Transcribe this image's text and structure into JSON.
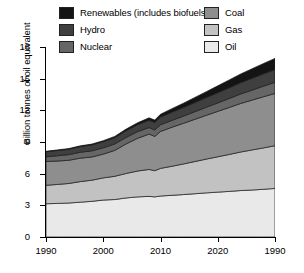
{
  "chart_data": {
    "type": "area",
    "stacked": true,
    "title": "",
    "subtitle": "",
    "xlabel": "",
    "ylabel": "Billion tonnes of oil equivalent",
    "xlim": [
      1990,
      2030
    ],
    "ylim": [
      0,
      18
    ],
    "yticks": [
      0,
      3,
      6,
      9,
      12,
      15,
      18
    ],
    "xticks": [
      1990,
      2000,
      2010,
      2020,
      1990
    ],
    "xtick_labels": [
      "1990",
      "2000",
      "2010",
      "2020",
      "1990"
    ],
    "grid": false,
    "legend_position": "top",
    "x": [
      1990,
      1992,
      1994,
      1996,
      1998,
      2000,
      2002,
      2004,
      2006,
      2008,
      2009,
      2010,
      2012,
      2014,
      2016,
      2018,
      2020,
      2022,
      2024,
      2026,
      2028,
      2030
    ],
    "series": [
      {
        "name": "Oil",
        "color": "#e9e9e9",
        "values": [
          3.15,
          3.18,
          3.22,
          3.3,
          3.38,
          3.5,
          3.55,
          3.7,
          3.8,
          3.85,
          3.8,
          3.88,
          3.95,
          4.02,
          4.1,
          4.18,
          4.25,
          4.32,
          4.4,
          4.45,
          4.52,
          4.6
        ]
      },
      {
        "name": "Gas",
        "color": "#c2c2c2",
        "values": [
          1.75,
          1.8,
          1.85,
          1.95,
          2.0,
          2.1,
          2.2,
          2.32,
          2.45,
          2.55,
          2.48,
          2.62,
          2.75,
          2.9,
          3.05,
          3.2,
          3.35,
          3.5,
          3.65,
          3.8,
          3.92,
          4.05
        ]
      },
      {
        "name": "Coal",
        "color": "#8e8e8e",
        "values": [
          2.25,
          2.22,
          2.2,
          2.22,
          2.2,
          2.25,
          2.45,
          2.8,
          3.1,
          3.35,
          3.25,
          3.5,
          3.7,
          3.85,
          4.0,
          4.15,
          4.3,
          4.45,
          4.6,
          4.72,
          4.85,
          4.95
        ]
      },
      {
        "name": "Nuclear",
        "color": "#666666",
        "values": [
          0.45,
          0.5,
          0.53,
          0.56,
          0.58,
          0.6,
          0.61,
          0.62,
          0.63,
          0.62,
          0.6,
          0.63,
          0.65,
          0.68,
          0.72,
          0.76,
          0.8,
          0.85,
          0.9,
          0.95,
          1.0,
          1.05
        ]
      },
      {
        "name": "Hydro",
        "color": "#3f3f3f",
        "values": [
          0.48,
          0.5,
          0.52,
          0.54,
          0.56,
          0.58,
          0.6,
          0.63,
          0.66,
          0.7,
          0.71,
          0.73,
          0.78,
          0.82,
          0.87,
          0.92,
          0.97,
          1.02,
          1.07,
          1.12,
          1.17,
          1.22
        ]
      },
      {
        "name": "Renewables (includes biofuels)",
        "color": "#141414",
        "values": [
          0.04,
          0.05,
          0.06,
          0.07,
          0.08,
          0.1,
          0.12,
          0.15,
          0.18,
          0.22,
          0.24,
          0.27,
          0.33,
          0.4,
          0.48,
          0.56,
          0.65,
          0.74,
          0.82,
          0.9,
          0.98,
          1.05
        ]
      }
    ],
    "legend": [
      {
        "label": "Renewables (includes biofuels)",
        "color": "#141414"
      },
      {
        "label": "Hydro",
        "color": "#3f3f3f"
      },
      {
        "label": "Nuclear",
        "color": "#666666"
      },
      {
        "label": "Coal",
        "color": "#8e8e8e"
      },
      {
        "label": "Gas",
        "color": "#c2c2c2"
      },
      {
        "label": "Oil",
        "color": "#e9e9e9"
      }
    ]
  }
}
